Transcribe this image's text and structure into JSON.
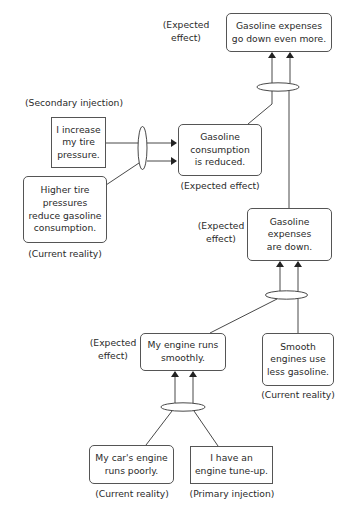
{
  "diagram": {
    "type": "future-reality-tree",
    "nodes": [
      {
        "id": "expenses-down-more",
        "text": "Gasoline expenses\ngo down even more.",
        "shape": "rounded",
        "tag": "(Expected effect)"
      },
      {
        "id": "increase-tire-pressure",
        "text": "I increase\nmy tire\npressure.",
        "shape": "square",
        "tag": "(Secondary injection)"
      },
      {
        "id": "higher-tire-pressures",
        "text": "Higher tire\npressures\nreduce gasoline\nconsumption.",
        "shape": "rounded",
        "tag": "(Current reality)"
      },
      {
        "id": "consumption-reduced",
        "text": "Gasoline\nconsumption\nis reduced.",
        "shape": "rounded",
        "tag": "(Expected effect)"
      },
      {
        "id": "expenses-down",
        "text": "Gasoline\nexpenses\nare down.",
        "shape": "rounded",
        "tag": "(Expected\neffect)"
      },
      {
        "id": "engine-runs-smoothly",
        "text": "My engine runs\nsmoothly.",
        "shape": "rounded",
        "tag": "(Expected\neffect)"
      },
      {
        "id": "smooth-engines",
        "text": "Smooth\nengines use\nless gasoline.",
        "shape": "rounded",
        "tag": "(Current reality)"
      },
      {
        "id": "engine-runs-poorly",
        "text": "My car's engine\nruns poorly.",
        "shape": "rounded",
        "tag": "(Current reality)"
      },
      {
        "id": "engine-tune-up",
        "text": "I have an\nengine tune-up.",
        "shape": "square",
        "tag": "(Primary injection)"
      }
    ],
    "edges": [
      {
        "and_group": [
          "engine-runs-poorly",
          "engine-tune-up"
        ],
        "to": "engine-runs-smoothly"
      },
      {
        "and_group": [
          "engine-runs-smoothly",
          "smooth-engines"
        ],
        "to": "expenses-down"
      },
      {
        "and_group": [
          "increase-tire-pressure",
          "higher-tire-pressures"
        ],
        "to": "consumption-reduced"
      },
      {
        "and_group": [
          "consumption-reduced",
          "expenses-down"
        ],
        "to": "expenses-down-more"
      }
    ],
    "colors": {
      "line": "#333333",
      "border": "#555555",
      "background": "#ffffff"
    }
  }
}
